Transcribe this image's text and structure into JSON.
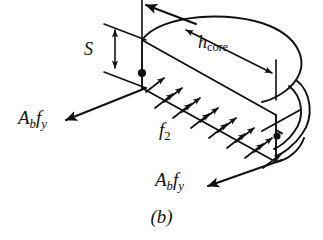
{
  "figure": {
    "caption": "(b)",
    "type": "engineering-free-body-diagram",
    "stroke_color": "#111111",
    "background_color": "#ffffff"
  },
  "labels": {
    "force_left": {
      "base": "A",
      "sub1": "b",
      "sym2": "f",
      "sub2": "y"
    },
    "force_bottom": {
      "base": "A",
      "sub1": "b",
      "sym2": "f",
      "sub2": "y"
    },
    "core_depth": {
      "base": "h",
      "sub": "core"
    },
    "pressure": {
      "base": "f",
      "sub": "2"
    },
    "spacing": {
      "base": "S"
    }
  },
  "annotations": {
    "pressure_arrow_count": 14,
    "pressure_arrow_rows": 2,
    "dimension_arrows": [
      "S vertical double-headed",
      "h_core diagonal double-headed"
    ],
    "force_arrows": [
      "upper-left out-of-plane",
      "left downward-left",
      "bottom downward-left"
    ]
  }
}
